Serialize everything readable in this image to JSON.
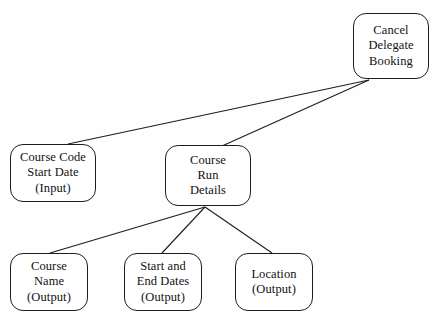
{
  "diagram": {
    "type": "jackson-structure-diagram",
    "background_color": "#fefefe",
    "line_color": "#1d1d1d",
    "text_color": "#111111",
    "nodes": [
      {
        "id": "cancel-delegate-booking",
        "name": "cancel-delegate-booking",
        "lines": [
          "Cancel",
          "Delegate",
          "Booking"
        ],
        "x": 353,
        "y": 13,
        "width": 76,
        "height": 66
      },
      {
        "id": "course-code-start-date-input",
        "name": "course-code-start-date-input",
        "lines": [
          "Course Code",
          "Start Date",
          "(Input)"
        ],
        "x": 10,
        "y": 144,
        "width": 86,
        "height": 58
      },
      {
        "id": "course-run-details",
        "name": "course-run-details",
        "lines": [
          "Course",
          "Run",
          "Details"
        ],
        "x": 165,
        "y": 145,
        "width": 86,
        "height": 61
      },
      {
        "id": "course-name-output",
        "name": "course-name-output",
        "lines": [
          "Course",
          "Name",
          "(Output)"
        ],
        "x": 10,
        "y": 253,
        "width": 78,
        "height": 58
      },
      {
        "id": "start-and-end-dates-output",
        "name": "start-and-end-dates-output",
        "lines": [
          "Start and",
          "End Dates",
          "(Output)"
        ],
        "x": 124,
        "y": 253,
        "width": 78,
        "height": 58
      },
      {
        "id": "location-output",
        "name": "location-output",
        "lines": [
          "Location",
          "(Output)"
        ],
        "x": 235,
        "y": 253,
        "width": 78,
        "height": 58
      }
    ],
    "connectors": [
      {
        "id": "connector-cancel-to-course-code",
        "name": "connector-cancel-to-course-code",
        "from": "cancel-delegate-booking",
        "to": "course-code-start-date-input",
        "x1": 369,
        "y1": 80,
        "x2": 68,
        "y2": 144
      },
      {
        "id": "connector-cancel-to-course-run",
        "name": "connector-cancel-to-course-run",
        "from": "cancel-delegate-booking",
        "to": "course-run-details",
        "x1": 369,
        "y1": 80,
        "x2": 222,
        "y2": 146
      },
      {
        "id": "connector-course-run-to-course-name",
        "name": "connector-course-run-to-course-name",
        "from": "course-run-details",
        "to": "course-name-output",
        "x1": 205,
        "y1": 207,
        "x2": 50,
        "y2": 253
      },
      {
        "id": "connector-course-run-to-start-end-dates",
        "name": "connector-course-run-to-start-end-dates",
        "from": "course-run-details",
        "to": "start-and-end-dates-output",
        "x1": 205,
        "y1": 207,
        "x2": 162,
        "y2": 253
      },
      {
        "id": "connector-course-run-to-location",
        "name": "connector-course-run-to-location",
        "from": "course-run-details",
        "to": "location-output",
        "x1": 205,
        "y1": 207,
        "x2": 272,
        "y2": 253
      }
    ]
  }
}
